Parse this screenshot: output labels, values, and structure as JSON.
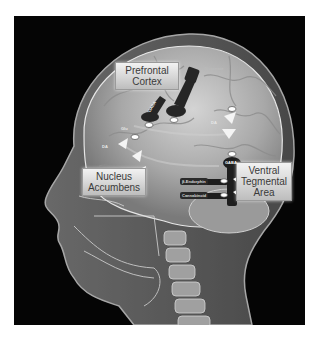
{
  "diagram": {
    "type": "anatomical-illustration",
    "regions": [
      {
        "id": "pfc",
        "label_line1": "Prefrontal",
        "label_line2": "Cortex"
      },
      {
        "id": "nac",
        "label_line1": "Nucleus",
        "label_line2": "Accumbens"
      },
      {
        "id": "vta",
        "label_line1": "Ventral",
        "label_line2": "Tegmental",
        "label_line3": "Area"
      }
    ],
    "neurotransmitters": {
      "gaba_pfc": "GABA",
      "glu_pfc": "Glu",
      "da_pfc": "DA",
      "glu_nac": "Glu",
      "da_nac": "DA",
      "gaba_vta": "GABA",
      "endorphin": "β-Endorphin",
      "cannabinoid": "Cannabinoid",
      "glutamate_top": "Glutamate",
      "dynorphin": "Dynorphin"
    },
    "colors": {
      "background": "#050505",
      "tissue": "#bfbfbf",
      "label_box": "#d9d9d9",
      "neuron": "#2a2a2a",
      "terminal": "#f5f5f5"
    }
  }
}
